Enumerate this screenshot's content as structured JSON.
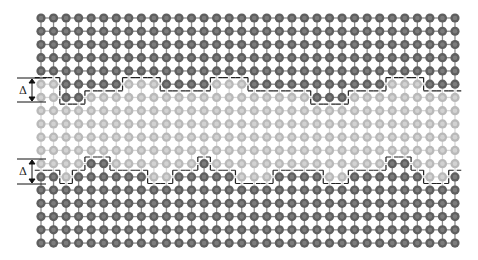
{
  "figure": {
    "type": "atomic-lattice-interface-schematic",
    "lattice": {
      "rows": 18,
      "cols": 34,
      "origin_x": 41,
      "origin_y": 18,
      "spacing_x": 12.545,
      "spacing_y": 13.24,
      "atom_radius": 4.6
    },
    "colors": {
      "dark_atom": "#5f5f5f",
      "dark_atom_center": "#7c7c7c",
      "light_atom": "#b9b9b9",
      "light_atom_center": "#d2d2d2",
      "bond_dark": "#8a8a8a",
      "bond_light": "#d6d6d6",
      "dash": "#222222"
    },
    "row_patterns": {
      "0": "all-dark",
      "1": "all-dark",
      "2": "all-dark",
      "3": "all-dark",
      "4": "all-dark",
      "5": [
        [
          2,
          6
        ],
        [
          10,
          13
        ],
        [
          17,
          27
        ],
        [
          31,
          33
        ]
      ],
      "6": [
        [
          2,
          3
        ],
        [
          22,
          24
        ]
      ],
      "7": "all-light",
      "8": "all-light",
      "9": "all-light",
      "10": "all-light",
      "11": [
        [
          4,
          5
        ],
        [
          13,
          13
        ],
        [
          28,
          29
        ]
      ],
      "12": [
        [
          0,
          1
        ],
        [
          3,
          8
        ],
        [
          11,
          15
        ],
        [
          19,
          22
        ],
        [
          25,
          30
        ],
        [
          33,
          33
        ]
      ],
      "13": "all-dark",
      "14": "all-dark",
      "15": "all-dark",
      "16": "all-dark",
      "17": "all-dark"
    },
    "annotations": [
      {
        "label": "Δ",
        "top_y": 78,
        "bottom_y": 102,
        "label_x": 19,
        "label_y": 85
      },
      {
        "label": "Δ",
        "top_y": 159,
        "bottom_y": 184,
        "label_x": 19,
        "label_y": 166
      }
    ],
    "upper_interface_label": "Δ",
    "lower_interface_label": "Δ"
  }
}
